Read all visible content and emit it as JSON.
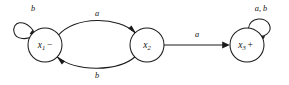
{
  "figure": {
    "type": "state-transition-diagram",
    "background_color": "#ffffff",
    "stroke_color": "#1a1a1a",
    "width": 289,
    "height": 85
  },
  "states": [
    {
      "id": "x1",
      "name": "x",
      "subscript": "1",
      "sign": "−",
      "cx": 45,
      "cy": 45,
      "r": 17
    },
    {
      "id": "x2",
      "name": "x",
      "subscript": "2",
      "sign": "",
      "cx": 147,
      "cy": 45,
      "r": 17
    },
    {
      "id": "x3",
      "name": "x",
      "subscript": "3",
      "sign": "+",
      "cx": 247,
      "cy": 45,
      "r": 17
    }
  ],
  "transitions": [
    {
      "id": "x1-self",
      "from": "x1",
      "to": "x1",
      "label": "b",
      "label_x": 33,
      "label_y": 9,
      "shape": "self-loop-upper-left"
    },
    {
      "id": "x1-to-x2",
      "from": "x1",
      "to": "x2",
      "label": "a",
      "label_x": 97,
      "label_y": 14,
      "shape": "arc-above"
    },
    {
      "id": "x2-to-x1",
      "from": "x2",
      "to": "x1",
      "label": "b",
      "label_x": 97,
      "label_y": 76,
      "shape": "arc-below"
    },
    {
      "id": "x2-to-x3",
      "from": "x2",
      "to": "x3",
      "label": "a",
      "label_x": 197,
      "label_y": 35,
      "shape": "straight"
    },
    {
      "id": "x3-self",
      "from": "x3",
      "to": "x3",
      "label": "a, b",
      "label_x": 261,
      "label_y": 9,
      "shape": "self-loop-upper-right"
    }
  ]
}
